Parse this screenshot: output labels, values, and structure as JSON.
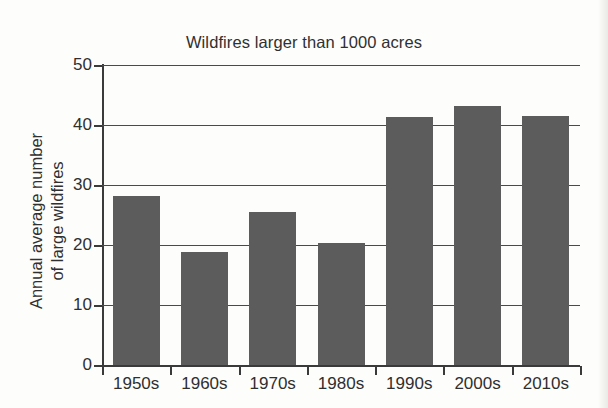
{
  "chart_data": {
    "type": "bar",
    "title": "Wildfires larger than 1000 acres",
    "xlabel": "",
    "ylabel": "Annual average number\nof large wildfires",
    "categories": [
      "1950s",
      "1960s",
      "1970s",
      "1980s",
      "1990s",
      "2000s",
      "2010s"
    ],
    "values": [
      28.2,
      18.8,
      25.5,
      20.3,
      41.3,
      43.1,
      41.5
    ],
    "ylim": [
      0,
      50
    ],
    "yticks": [
      0,
      10,
      20,
      30,
      40,
      50
    ],
    "ytick_labels": [
      "0",
      "10",
      "20",
      "30",
      "40",
      "50"
    ],
    "grid": true,
    "grid_axis": "y",
    "legend": false,
    "bar_color": "#5c5c5c",
    "axis_color": "#3a3a3a",
    "background_color": "#fdfdfb"
  }
}
